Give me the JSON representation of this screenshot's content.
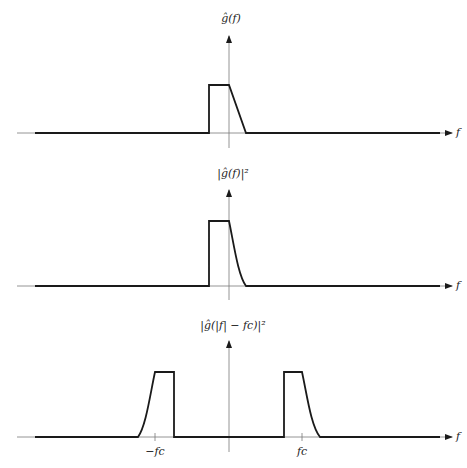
{
  "panels": [
    {
      "id": "top",
      "y_label": "ĝ(f)",
      "x_label": "f",
      "description": "Baseband spectrum: rectangle on left of origin, linear ramp down on right"
    },
    {
      "id": "middle",
      "y_label": "|ĝ(f)|²",
      "x_label": "f",
      "description": "Squared magnitude: rectangle on left, curved decay on right"
    },
    {
      "id": "bottom",
      "y_label": "|ĝ(|f| − fc)|²",
      "x_label": "f",
      "ticks": [
        "−fc",
        "fc"
      ],
      "description": "Passband spectrum: two mirrored pulses centered at ±fc"
    }
  ],
  "colors": {
    "stroke": "#1a1a1a",
    "axis": "#7a7a7a",
    "background": "#ffffff"
  }
}
